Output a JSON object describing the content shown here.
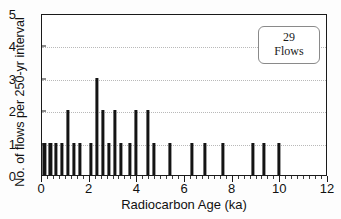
{
  "chart_data": {
    "type": "bar",
    "title": "",
    "xlabel": "Radiocarbon Age (ka)",
    "ylabel": "No. of flows per 250-yr interval",
    "xlim": [
      0,
      12
    ],
    "ylim": [
      0,
      5
    ],
    "grid": true,
    "bar_color": "#141414",
    "x_ticks": [
      0,
      2,
      4,
      6,
      8,
      10,
      12
    ],
    "x_tick_labels": [
      "0",
      "2",
      "4",
      "6",
      "8",
      "10",
      "12"
    ],
    "x_minor_tick_step": 0.25,
    "y_ticks": [
      0,
      1,
      2,
      3,
      4,
      5
    ],
    "y_tick_labels": [
      "0",
      "1",
      "2",
      "3",
      "4",
      "5"
    ],
    "bin_width_ka": 0.25,
    "x": [
      0.1,
      0.35,
      0.6,
      0.85,
      1.1,
      1.35,
      1.6,
      2.05,
      2.3,
      2.55,
      2.8,
      3.05,
      3.3,
      3.7,
      3.95,
      4.45,
      4.7,
      5.35,
      6.3,
      6.85,
      7.6,
      8.85,
      9.3,
      9.95,
      12.0
    ],
    "values": [
      1,
      1,
      1,
      1,
      2,
      1,
      1,
      1,
      3,
      2,
      1,
      2,
      1,
      1,
      2,
      2,
      1,
      1,
      1,
      1,
      1,
      1,
      1,
      1,
      1
    ],
    "annotations": [
      {
        "name": "flow-count-box",
        "count": "29",
        "label": "Flows"
      }
    ],
    "legend": {
      "position": "top-right",
      "count": "29",
      "label": "Flows"
    }
  }
}
